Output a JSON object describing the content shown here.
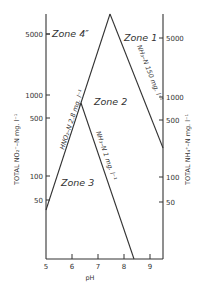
{
  "diagram": {
    "type": "zone-diagram",
    "colors": {
      "ink": "#333333",
      "background": "#ffffff"
    },
    "x_axis": {
      "label": "pH",
      "ticks": [
        "5",
        "6",
        "7",
        "8",
        "9"
      ]
    },
    "left_axis": {
      "label": "TOTAL NO₂⁻–N  mg. l⁻¹",
      "ticks": [
        "5000",
        "1000",
        "500",
        "100",
        "50"
      ]
    },
    "right_axis": {
      "label": "TOTAL NH₄⁺–N  mg. l⁻¹",
      "ticks": [
        "5000",
        "1000",
        "500",
        "100",
        "50"
      ]
    },
    "zones": [
      {
        "id": "zone4",
        "label": "Zone 4″"
      },
      {
        "id": "zone1",
        "label": "Zone 1"
      },
      {
        "id": "zone2",
        "label": "Zone 2"
      },
      {
        "id": "zone3",
        "label": "Zone 3"
      }
    ],
    "lines": [
      {
        "id": "hno2",
        "label": "HNO₂–N  2.8 mg. l⁻¹"
      },
      {
        "id": "nh3_150",
        "label": "NH₃–N  150 mg. l⁻¹"
      },
      {
        "id": "nh3_1",
        "label": "NH₃–N  1 mg. l⁻¹"
      }
    ]
  }
}
